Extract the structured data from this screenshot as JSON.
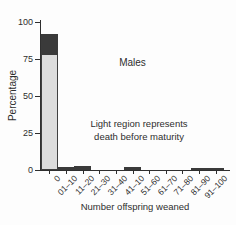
{
  "figure": {
    "males_label": "Males",
    "annotation": {
      "line1": "Light region represents",
      "line2": "death before maturity"
    }
  },
  "colors": {
    "background": "#fdfdfd",
    "bar_light": "#dcdcdc",
    "bar_dark": "#3a3a3a",
    "axis": "#2f2f2f",
    "text": "#2e2e2e"
  },
  "chart_data": {
    "type": "bar",
    "stacked": true,
    "title": "",
    "xlabel": "Number offspring weaned",
    "ylabel": "Percentage",
    "ylim": [
      0,
      100
    ],
    "yticks": [
      0,
      25,
      50,
      75,
      100
    ],
    "grid": false,
    "legend": "none",
    "categories": [
      "0",
      "01–10",
      "11–20",
      "21–30",
      "31–40",
      "41–10",
      "51–60",
      "61–70",
      "71–80",
      "81–90",
      "91–100"
    ],
    "series": [
      {
        "name": "light-region-death-before-maturity",
        "color": "#dcdcdc",
        "values": [
          78,
          0,
          0,
          0,
          0,
          0,
          0,
          0,
          0,
          0,
          0
        ]
      },
      {
        "name": "dark-region-survived",
        "color": "#3a3a3a",
        "values": [
          14,
          2,
          3,
          0,
          0,
          2,
          0,
          0,
          0,
          1.5,
          1.5
        ]
      }
    ],
    "annotations": [
      "Males",
      "Light region represents death before maturity"
    ]
  }
}
